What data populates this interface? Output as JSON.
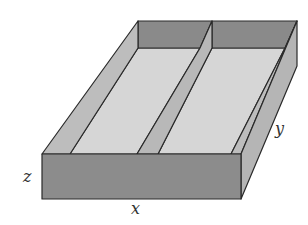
{
  "figure": {
    "labels": {
      "x": "x",
      "y": "y",
      "z": "z"
    },
    "colors": {
      "front_face": "#8c8c8c",
      "back_wall": "#8a8a8a",
      "side_wall_inner": "#bdbdbd",
      "floor": "#d6d6d6",
      "divider_face": "#b8b8b8",
      "right_face": "#b5b5b5",
      "edge": "#2a2a2a",
      "background": "#ffffff"
    }
  }
}
